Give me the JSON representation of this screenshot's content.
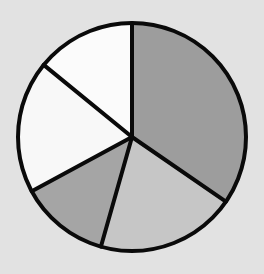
{
  "chart_data": {
    "type": "pie",
    "title": "",
    "legend": [],
    "start_angle_deg": 0,
    "direction": "clockwise",
    "categories": [
      "Slice A",
      "Slice B",
      "Slice C",
      "Slice D",
      "Slice E"
    ],
    "values": [
      34.6,
      19.8,
      12.7,
      18.8,
      14.1
    ],
    "colors": [
      "#9d9d9d",
      "#c6c6c6",
      "#a5a5a5",
      "#f8f8f8",
      "#fbfbfb"
    ],
    "labels_visible": false
  },
  "style": {
    "background": "#e2e2e2",
    "outline": "#0a0a0a",
    "outline_width": 4,
    "center": [
      132,
      137
    ],
    "radius": 114
  }
}
